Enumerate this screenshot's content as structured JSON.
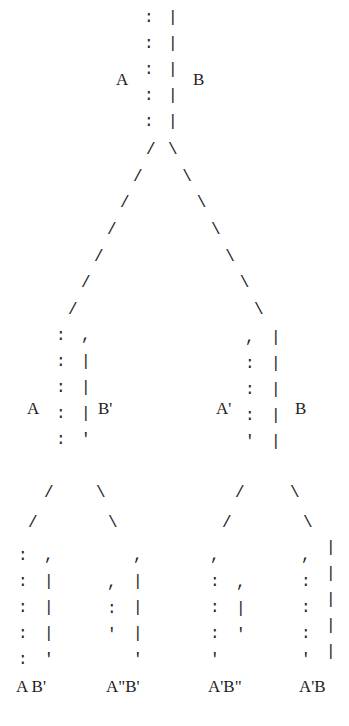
{
  "diagram": {
    "type": "binary-tree",
    "style": "typewritten",
    "root": {
      "left_label": "A",
      "right_label": "B",
      "left_column": [
        ":",
        ":",
        ":",
        ":",
        ":"
      ],
      "right_column": [
        "|",
        "|",
        "|",
        "|",
        "|"
      ]
    },
    "level1": [
      {
        "left_label": "A",
        "right_label": "B'",
        "left_column": [
          ":",
          ":",
          ":",
          ":",
          ":"
        ],
        "right_column": [
          ",",
          "|",
          "|",
          "|",
          "'"
        ]
      },
      {
        "left_label": "A'",
        "right_label": "B",
        "left_column": [
          ",",
          ":",
          ":",
          ":",
          "'"
        ],
        "right_column": [
          "|",
          "|",
          "|",
          "|",
          "|"
        ]
      }
    ],
    "leaves": [
      {
        "label": "A B'",
        "left_column": [
          ":",
          ":",
          ":",
          ":",
          ":"
        ],
        "right_column": [
          ",",
          "|",
          "|",
          "|",
          "'"
        ]
      },
      {
        "label": "A\"B'",
        "left_column": [
          ",",
          ":",
          "'"
        ],
        "right_column": [
          ",",
          "|",
          "|",
          "|",
          "'"
        ]
      },
      {
        "label": "A'B\"",
        "left_column": [
          ",",
          ":",
          ":",
          ":",
          "'"
        ],
        "right_column": [
          ",",
          "|",
          "'"
        ]
      },
      {
        "label": "A'B",
        "left_column": [
          ",",
          ":",
          ":",
          ":",
          "'"
        ],
        "right_column": [
          "|",
          "|",
          "|",
          "|",
          "|"
        ]
      }
    ]
  }
}
